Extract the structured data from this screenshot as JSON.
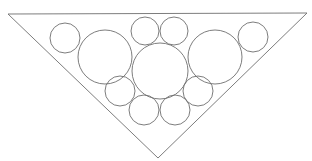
{
  "diagram": {
    "stroke_color": "#6e6e6e",
    "background": "#ffffff",
    "triangle": {
      "points": [
        [
          8,
          14
        ],
        [
          307,
          13
        ],
        [
          158,
          158
        ]
      ]
    },
    "circles": [
      {
        "id": "top-left-small",
        "cx": 65,
        "cy": 38,
        "r": 15
      },
      {
        "id": "left-large",
        "cx": 105,
        "cy": 57,
        "r": 27
      },
      {
        "id": "top-center-left-small",
        "cx": 145,
        "cy": 31,
        "r": 14
      },
      {
        "id": "top-center-right-small",
        "cx": 174,
        "cy": 31,
        "r": 14
      },
      {
        "id": "center-large",
        "cx": 160,
        "cy": 71,
        "r": 28
      },
      {
        "id": "right-large",
        "cx": 215,
        "cy": 57,
        "r": 27
      },
      {
        "id": "top-right-small",
        "cx": 253,
        "cy": 37,
        "r": 15
      },
      {
        "id": "lower-left-small",
        "cx": 120,
        "cy": 91,
        "r": 15
      },
      {
        "id": "bottom-left-small",
        "cx": 144,
        "cy": 110,
        "r": 15
      },
      {
        "id": "bottom-right-small",
        "cx": 175,
        "cy": 110,
        "r": 15
      },
      {
        "id": "lower-right-small",
        "cx": 198,
        "cy": 91,
        "r": 15
      }
    ]
  }
}
